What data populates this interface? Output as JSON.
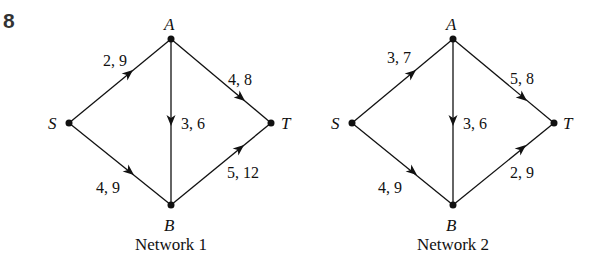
{
  "question_number": "8",
  "networks": [
    {
      "title": "Network 1",
      "nodes": {
        "S": {
          "label": "S",
          "x": 69,
          "y": 123
        },
        "A": {
          "label": "A",
          "x": 171,
          "y": 39
        },
        "B": {
          "label": "B",
          "x": 171,
          "y": 205
        },
        "T": {
          "label": "T",
          "x": 271,
          "y": 123
        }
      },
      "edges": [
        {
          "from": "S",
          "to": "A",
          "label": "2, 9"
        },
        {
          "from": "S",
          "to": "B",
          "label": "4, 9"
        },
        {
          "from": "A",
          "to": "B",
          "label": "3, 6"
        },
        {
          "from": "A",
          "to": "T",
          "label": "4, 8"
        },
        {
          "from": "B",
          "to": "T",
          "label": "5, 12"
        }
      ]
    },
    {
      "title": "Network 2",
      "nodes": {
        "S": {
          "label": "S",
          "x": 352,
          "y": 123
        },
        "A": {
          "label": "A",
          "x": 453,
          "y": 39
        },
        "B": {
          "label": "B",
          "x": 453,
          "y": 205
        },
        "T": {
          "label": "T",
          "x": 554,
          "y": 123
        }
      },
      "edges": [
        {
          "from": "S",
          "to": "A",
          "label": "3, 7"
        },
        {
          "from": "S",
          "to": "B",
          "label": "4, 9"
        },
        {
          "from": "A",
          "to": "B",
          "label": "3, 6"
        },
        {
          "from": "A",
          "to": "T",
          "label": "5, 8"
        },
        {
          "from": "B",
          "to": "T",
          "label": "2, 9"
        }
      ]
    }
  ]
}
